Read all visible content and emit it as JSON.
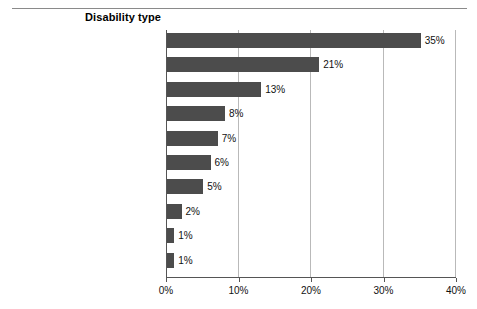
{
  "header": {
    "title": "Disability type"
  },
  "chart_data": {
    "type": "bar",
    "orientation": "horizontal",
    "title": "Disability type",
    "xlabel": "",
    "ylabel": "",
    "xlim": [
      0,
      40
    ],
    "grid": true,
    "legend": false,
    "value_suffix": "%",
    "categories": [
      "Specific learning disability",
      "Speech or language impairment",
      "Other health impairment",
      "Autism",
      "Intellectual disability",
      "Developmental delay",
      "Emotional disturbance",
      "Multiple disabilities",
      "Hearing impairment",
      "Orthopedic impairment"
    ],
    "values": [
      35,
      21,
      13,
      8,
      7,
      6,
      5,
      2,
      1,
      1
    ],
    "data_labels": [
      "35%",
      "21%",
      "13%",
      "8%",
      "7%",
      "6%",
      "5%",
      "2%",
      "1%",
      "1%"
    ],
    "xticks": [
      0,
      10,
      20,
      30,
      40
    ],
    "xtick_labels": [
      "0%",
      "10%",
      "20%",
      "30%",
      "40%"
    ],
    "bar_color": "#4c4c4c",
    "grid_color": "#b9b9b9",
    "axis_color": "#555555"
  }
}
